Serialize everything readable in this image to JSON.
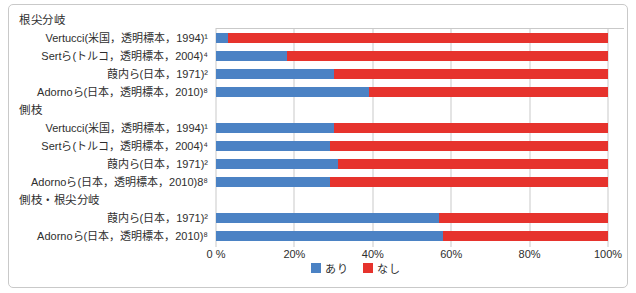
{
  "colors": {
    "present": "#4b82c4",
    "absent": "#e6332d",
    "grid": "#c9c9c9",
    "border": "#c9c9c9",
    "text": "#2e2e2e"
  },
  "legend": {
    "present_label": "あり",
    "absent_label": "なし"
  },
  "axis": {
    "ticks": [
      "0 %",
      "20%",
      "40%",
      "60%",
      "80%",
      "100%"
    ]
  },
  "chart_data": {
    "type": "bar",
    "orientation": "horizontal",
    "stacked": true,
    "series_names": [
      "あり",
      "なし"
    ],
    "xlim": [
      0,
      100
    ],
    "grid": true,
    "legend_position": "bottom-center",
    "groups": [
      {
        "header": "根尖分岐",
        "rows": [
          {
            "label": "Vertucci(米国，透明標本，1994)¹",
            "present": 3,
            "absent": 97
          },
          {
            "label": "Sertら(トルコ，透明標本，2004)⁴",
            "present": 18,
            "absent": 82
          },
          {
            "label": "葭内ら(日本，1971)²",
            "present": 30,
            "absent": 70
          },
          {
            "label": "Adornoら(日本，透明標本，2010)⁸",
            "present": 39,
            "absent": 61
          }
        ]
      },
      {
        "header": "側枝",
        "rows": [
          {
            "label": "Vertucci(米国，透明標本，1994)¹",
            "present": 30,
            "absent": 70
          },
          {
            "label": "Sertら(トルコ，透明標本，2004)⁴",
            "present": 29,
            "absent": 71
          },
          {
            "label": "葭内ら(日本，1971)²",
            "present": 31,
            "absent": 69
          },
          {
            "label": "Adornoら(日本，透明標本，2010)8⁸",
            "present": 29,
            "absent": 71
          }
        ]
      },
      {
        "header": "側枝・根尖分岐",
        "rows": [
          {
            "label": "葭内ら(日本，1971)²",
            "present": 57,
            "absent": 43
          },
          {
            "label": "Adornoら(日本，透明標本，2010)⁸",
            "present": 58,
            "absent": 42
          }
        ]
      }
    ]
  }
}
